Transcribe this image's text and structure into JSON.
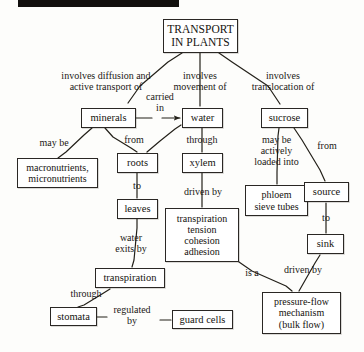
{
  "diagram": {
    "title_node": "TRANSPORT\nIN PLANTS",
    "top_bar": {
      "color": "#12100e"
    },
    "nodes": [
      {
        "id": "transport-in-plants",
        "text": "TRANSPORT\nIN PLANTS",
        "x": 163,
        "y": 19,
        "w": 75,
        "h": 34,
        "fs": 11.5
      },
      {
        "id": "minerals",
        "text": "minerals",
        "x": 81,
        "y": 108,
        "w": 55,
        "h": 20,
        "fs": 10.5
      },
      {
        "id": "water",
        "text": "water",
        "x": 182,
        "y": 108,
        "w": 41,
        "h": 20,
        "fs": 10.5
      },
      {
        "id": "sucrose",
        "text": "sucrose",
        "x": 261,
        "y": 108,
        "w": 47,
        "h": 20,
        "fs": 10.5
      },
      {
        "id": "macronutrients-micronutrients",
        "text": "macronutrients,\nmicronutrients",
        "x": 17,
        "y": 158,
        "w": 81,
        "h": 30,
        "fs": 10
      },
      {
        "id": "roots",
        "text": "roots",
        "x": 117,
        "y": 153,
        "w": 41,
        "h": 20,
        "fs": 10.5
      },
      {
        "id": "xylem",
        "text": "xylem",
        "x": 182,
        "y": 153,
        "w": 41,
        "h": 20,
        "fs": 10.5
      },
      {
        "id": "phloem-sieve-tubes",
        "text": "phloem\nsieve tubes",
        "x": 245,
        "y": 185,
        "w": 63,
        "h": 31,
        "fs": 10
      },
      {
        "id": "source",
        "text": "source",
        "x": 304,
        "y": 182,
        "w": 45,
        "h": 20,
        "fs": 10.5
      },
      {
        "id": "leaves",
        "text": "leaves",
        "x": 117,
        "y": 199,
        "w": 41,
        "h": 20,
        "fs": 10.5
      },
      {
        "id": "transpiration-tension-cohesion-adhesion",
        "text": "transpiration\ntension\ncohesion\nadhesion",
        "x": 165,
        "y": 208,
        "w": 74,
        "h": 54,
        "fs": 10
      },
      {
        "id": "sink",
        "text": "sink",
        "x": 307,
        "y": 234,
        "w": 37,
        "h": 20,
        "fs": 10.5
      },
      {
        "id": "transpiration",
        "text": "transpiration",
        "x": 95,
        "y": 268,
        "w": 70,
        "h": 20,
        "fs": 10.5
      },
      {
        "id": "stomata",
        "text": "stomata",
        "x": 50,
        "y": 307,
        "w": 47,
        "h": 19,
        "fs": 10.5
      },
      {
        "id": "guard-cells",
        "text": "guard cells",
        "x": 172,
        "y": 310,
        "w": 61,
        "h": 19,
        "fs": 10.5
      },
      {
        "id": "pressure-flow-mechanism",
        "text": "pressure-flow\nmechanism\n(bulk flow)",
        "x": 262,
        "y": 292,
        "w": 79,
        "h": 42,
        "fs": 10
      }
    ],
    "link_labels": [
      {
        "id": "involves-diffusion-and-active-transport-of",
        "text": "involves diffusion and\nactive transport of",
        "x": 46,
        "y": 70,
        "w": 120,
        "fs": 10
      },
      {
        "id": "involves-movement-of",
        "text": "involves\nmovement of",
        "x": 163,
        "y": 70,
        "w": 74,
        "fs": 10
      },
      {
        "id": "involves-translocation-of",
        "text": "involves\ntranslocation of",
        "x": 241,
        "y": 70,
        "w": 84,
        "fs": 10
      },
      {
        "id": "carried-in",
        "text": "carried\nin",
        "x": 138,
        "y": 91,
        "w": 44,
        "fs": 10
      },
      {
        "id": "may-be",
        "text": "may be",
        "x": 32,
        "y": 137,
        "w": 44,
        "fs": 10
      },
      {
        "id": "from-roots",
        "text": "from",
        "x": 118,
        "y": 134,
        "w": 32,
        "fs": 10
      },
      {
        "id": "through",
        "text": "through",
        "x": 178,
        "y": 134,
        "w": 48,
        "fs": 10
      },
      {
        "id": "may-be-actively-loaded-into",
        "text": "may be\nactively\nloaded into",
        "x": 245,
        "y": 134,
        "w": 63,
        "fs": 10
      },
      {
        "id": "from-source",
        "text": "from",
        "x": 311,
        "y": 140,
        "w": 32,
        "fs": 10
      },
      {
        "id": "to-leaves",
        "text": "to",
        "x": 126,
        "y": 180,
        "w": 22,
        "fs": 10
      },
      {
        "id": "driven-by-ttca",
        "text": "driven by",
        "x": 176,
        "y": 186,
        "w": 54,
        "fs": 10
      },
      {
        "id": "to-sink",
        "text": "to",
        "x": 315,
        "y": 212,
        "w": 22,
        "fs": 10
      },
      {
        "id": "water-exits-by",
        "text": "water\nexits by",
        "x": 107,
        "y": 232,
        "w": 48,
        "fs": 10
      },
      {
        "id": "driven-by-pressure-flow",
        "text": "driven by",
        "x": 276,
        "y": 264,
        "w": 54,
        "fs": 10
      },
      {
        "id": "is-a",
        "text": "is a",
        "x": 240,
        "y": 267,
        "w": 24,
        "fs": 10
      },
      {
        "id": "through-stomata",
        "text": "through",
        "x": 62,
        "y": 288,
        "w": 48,
        "fs": 10
      },
      {
        "id": "regulated-by",
        "text": "regulated\nby",
        "x": 103,
        "y": 304,
        "w": 58,
        "fs": 10
      }
    ],
    "edges": [
      {
        "id": "edge-title-to-minerals",
        "points": "182,53 168,62 140,86 128,103",
        "arrow": false
      },
      {
        "id": "edge-title-to-water",
        "points": "200,53 200,62 200,86 200,106",
        "arrow": false
      },
      {
        "id": "edge-title-to-sucrose",
        "points": "219,53 232,62 268,86 280,104",
        "arrow": false
      },
      {
        "id": "edge-minerals-to-water",
        "points": "136,118 152,118",
        "arrow": false
      },
      {
        "id": "edge-carried-in-to-water",
        "points": "162,118 180,118",
        "arrow": true
      },
      {
        "id": "edge-minerals-to-macro",
        "points": "92,128 84,135 66,152 58,158",
        "arrow": false
      },
      {
        "id": "edge-minerals-to-roots",
        "points": "105,128 113,137 131,148 137,152",
        "arrow": false
      },
      {
        "id": "edge-roots-to-water",
        "points": "147,152 160,141 175,129 181,125",
        "arrow": false
      },
      {
        "id": "edge-water-to-xylem",
        "points": "202,128 202,133 202,148 202,152",
        "arrow": false
      },
      {
        "id": "edge-roots-to-leaves",
        "points": "137,173 137,179 137,193 137,198",
        "arrow": false
      },
      {
        "id": "edge-xylem-to-ttca",
        "points": "202,173 202,180 202,200 202,207",
        "arrow": false
      },
      {
        "id": "edge-sucrose-to-phloem",
        "points": "279,128 278,136 277,172 277,184",
        "arrow": false
      },
      {
        "id": "edge-sucrose-to-source",
        "points": "294,128 302,140 320,170 325,181",
        "arrow": false
      },
      {
        "id": "edge-source-to-sink",
        "points": "326,203 326,212 326,228 326,233",
        "arrow": false
      },
      {
        "id": "edge-leaves-to-transpiration",
        "points": "137,219 137,228 134,260 132,267",
        "arrow": false
      },
      {
        "id": "edge-ttca-to-pressure-flow",
        "points": "239,262 252,271 286,286 292,291",
        "arrow": false
      },
      {
        "id": "edge-sink-to-pressure-flow",
        "points": "320,255 315,263 303,284 299,291",
        "arrow": false
      },
      {
        "id": "edge-transpiration-to-stomata",
        "points": "110,289 102,294 84,305 78,307",
        "arrow": false
      },
      {
        "id": "edge-stomata-to-regulated",
        "points": "97,317 107,317",
        "arrow": false
      },
      {
        "id": "edge-regulated-to-guard-cells",
        "points": "160,320 171,320",
        "arrow": false
      }
    ]
  }
}
